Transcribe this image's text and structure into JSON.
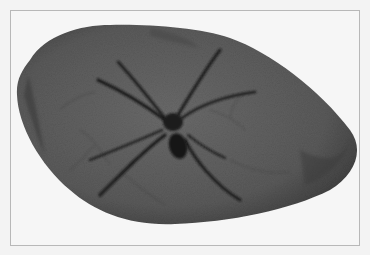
{
  "image": {
    "subject": "fossil spider preserved in a stone",
    "description": "Grayscale photograph of an oval, rounded stone slab showing a dark fossilized spider with long legs spread outward, inside a thin gray frame",
    "colors": {
      "background": "#f4f4f4",
      "frame_border": "#b8b8b8",
      "stone": "#5e5e5e",
      "stone_dark": "#3a3a3a",
      "spider": "#1c1c1c"
    }
  }
}
